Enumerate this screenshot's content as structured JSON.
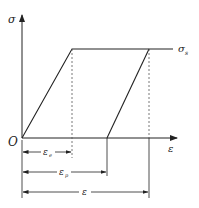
{
  "diagram": {
    "type": "stress-strain elastic-perfectly-plastic",
    "axes": {
      "y_label": "σ",
      "x_label": "ε",
      "origin_label": "O"
    },
    "yield_label": "σ",
    "yield_label_sub": "s",
    "dimensions": [
      {
        "label": "ε",
        "sub": "e"
      },
      {
        "label": "ε",
        "sub": "p"
      },
      {
        "label": "ε",
        "sub": ""
      }
    ],
    "colors": {
      "line": "#222222",
      "dashed": "#555555",
      "background": "#ffffff"
    }
  }
}
